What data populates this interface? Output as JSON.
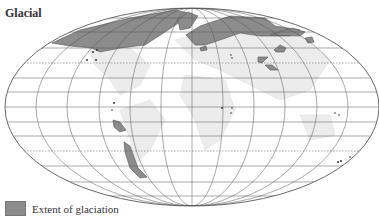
{
  "map": {
    "title": "Glacial",
    "projection": "Mollweide-style ellipse with graticule",
    "colors": {
      "glaciation": "#8c8c8c",
      "land": "#ececec",
      "grid": "#555555",
      "background": "#ffffff"
    }
  },
  "legend": {
    "items": [
      {
        "label": "Extent of glaciation",
        "color": "#8c8c8c"
      }
    ]
  }
}
